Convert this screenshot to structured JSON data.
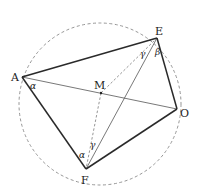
{
  "diagram": {
    "type": "geometry-cyclic-quadrilateral",
    "circle": {
      "cx": 100,
      "cy": 104,
      "r": 81,
      "style": "dashed",
      "color": "#8a8a8a"
    },
    "points": {
      "A": {
        "x": 22,
        "y": 77,
        "label": "A"
      },
      "E": {
        "x": 157,
        "y": 38,
        "label": "E"
      },
      "O": {
        "x": 177,
        "y": 109,
        "label": "O"
      },
      "F": {
        "x": 86,
        "y": 169,
        "label": "F"
      },
      "M": {
        "x": 101,
        "y": 93,
        "label": "M"
      }
    },
    "angles": {
      "alpha_A": "α",
      "alpha_F": "α",
      "beta_E": "β",
      "gamma_E": "γ",
      "gamma_F": "γ"
    },
    "colors": {
      "thick": "#2a2a2a",
      "thin": "#555555",
      "dashed": "#8a8a8a"
    }
  }
}
